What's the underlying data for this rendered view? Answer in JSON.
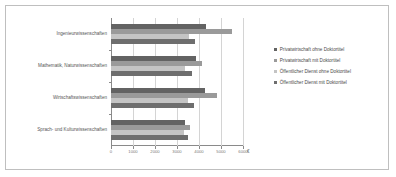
{
  "chart_data": {
    "type": "bar",
    "orientation": "horizontal",
    "title": "",
    "xlabel": "€",
    "ylabel": "",
    "xlim": [
      0,
      6000
    ],
    "xticks": [
      0,
      1000,
      2000,
      3000,
      4000,
      5000,
      6000
    ],
    "xticklabels": [
      "0",
      "1000",
      "2000",
      "3000",
      "4000",
      "5000",
      "6000"
    ],
    "grid": true,
    "grid_axis": "x",
    "legend_position": "right",
    "categories": [
      "Ingenieurwissenschaften",
      "Mathematik, Naturwissenschaften",
      "Wirtschaftswissenschaften",
      "Sprach- und Kulturwissenschaften"
    ],
    "series": [
      {
        "name": "Privatwirtschaft ohne Doktortitel",
        "color": "#636363",
        "values": [
          4300,
          3850,
          4250,
          3350
        ]
      },
      {
        "name": "Privatwirtschaft mit Doktortitel",
        "color": "#9a9a9a",
        "values": [
          5500,
          4150,
          4800,
          3600
        ]
      },
      {
        "name": "Öffentlicher Dienst ohne Doktortitel",
        "color": "#c4c4c4",
        "values": [
          3550,
          3350,
          3500,
          3300
        ]
      },
      {
        "name": "Öffentlicher Dienst mit Doktortitel",
        "color": "#6e6e6e",
        "values": [
          3800,
          3700,
          3750,
          3500
        ]
      }
    ]
  },
  "axis": {
    "unit_symbol": "€"
  }
}
